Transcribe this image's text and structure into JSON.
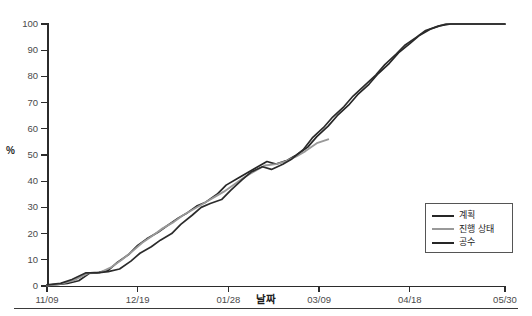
{
  "axes": {
    "y_label": "%",
    "x_label": "날짜",
    "y_ticks": [
      "0",
      "10",
      "20",
      "30",
      "40",
      "50",
      "60",
      "70",
      "80",
      "90",
      "100"
    ],
    "x_ticks": [
      "11/09",
      "12/19",
      "01/28",
      "03/09",
      "04/18",
      "05/30"
    ]
  },
  "legend": {
    "items": [
      {
        "label": "계획",
        "color": "#262626"
      },
      {
        "label": "진행 상태",
        "color": "#999999"
      },
      {
        "label": "공수",
        "color": "#262626"
      }
    ]
  },
  "colors": {
    "plan": "#262626",
    "progress": "#999999",
    "manhours": "#2b2b2b",
    "axis": "#2b2b2b",
    "tick_text": "#4a4a4a",
    "background": "#ffffff"
  },
  "chart_data": {
    "type": "line",
    "title": "",
    "subtitle": "",
    "xlabel": "날짜",
    "ylabel": "%",
    "xlim": [
      0,
      202
    ],
    "ylim": [
      0,
      100
    ],
    "grid": false,
    "legend_position": "bottom-right",
    "x_tick_labels": [
      "11/09",
      "12/19",
      "01/28",
      "03/09",
      "04/18",
      "05/30"
    ],
    "x_tick_values": [
      0,
      40,
      80,
      120,
      160,
      202
    ],
    "y_tick_values": [
      0,
      10,
      20,
      30,
      40,
      50,
      60,
      70,
      80,
      90,
      100
    ],
    "annotations": [],
    "series": [
      {
        "name": "계획",
        "color": "#262626",
        "points": [
          [
            0,
            0.3
          ],
          [
            5,
            0.6
          ],
          [
            9,
            1.0
          ],
          [
            14,
            2.0
          ],
          [
            19,
            5.0
          ],
          [
            23,
            5.2
          ],
          [
            27,
            6.0
          ],
          [
            31,
            9.0
          ],
          [
            36,
            12.0
          ],
          [
            40,
            15.5
          ],
          [
            44,
            18.0
          ],
          [
            49,
            20.5
          ],
          [
            53,
            23.0
          ],
          [
            58,
            26.0
          ],
          [
            62,
            28.0
          ],
          [
            66,
            30.5
          ],
          [
            70,
            32.0
          ],
          [
            75,
            35.0
          ],
          [
            79,
            38.5
          ],
          [
            84,
            41.0
          ],
          [
            88,
            43.0
          ],
          [
            92,
            45.0
          ],
          [
            97,
            47.5
          ],
          [
            101,
            46.5
          ],
          [
            106,
            48.0
          ],
          [
            110,
            50.0
          ],
          [
            115,
            53.0
          ],
          [
            119,
            57.0
          ],
          [
            124,
            61.0
          ],
          [
            128,
            65.0
          ],
          [
            133,
            69.0
          ],
          [
            137,
            73.0
          ],
          [
            142,
            77.0
          ],
          [
            146,
            81.0
          ],
          [
            151,
            85.0
          ],
          [
            155,
            89.0
          ],
          [
            160,
            92.5
          ],
          [
            164,
            95.5
          ],
          [
            169,
            98.0
          ],
          [
            173,
            99.3
          ],
          [
            178,
            100.0
          ],
          [
            187,
            100.0
          ],
          [
            196,
            100.0
          ],
          [
            202,
            100.0
          ]
        ]
      },
      {
        "name": "진행 상태",
        "color": "#999999",
        "points": [
          [
            0,
            0.2
          ],
          [
            6,
            0.8
          ],
          [
            12,
            2.2
          ],
          [
            18,
            4.8
          ],
          [
            23,
            5.0
          ],
          [
            28,
            7.0
          ],
          [
            33,
            10.0
          ],
          [
            38,
            13.5
          ],
          [
            42,
            16.5
          ],
          [
            47,
            19.5
          ],
          [
            51,
            22.0
          ],
          [
            56,
            24.5
          ],
          [
            60,
            27.0
          ],
          [
            65,
            29.5
          ],
          [
            69,
            31.5
          ],
          [
            74,
            34.0
          ],
          [
            78,
            36.0
          ],
          [
            83,
            39.0
          ],
          [
            87,
            41.5
          ],
          [
            92,
            44.0
          ],
          [
            96,
            46.0
          ],
          [
            101,
            46.5
          ],
          [
            105,
            47.5
          ],
          [
            110,
            49.5
          ],
          [
            114,
            51.5
          ],
          [
            119,
            54.5
          ],
          [
            124,
            56.0
          ]
        ]
      },
      {
        "name": "공수",
        "color": "#2b2b2b",
        "points": [
          [
            0,
            0.4
          ],
          [
            6,
            1.0
          ],
          [
            11,
            2.5
          ],
          [
            17,
            5.0
          ],
          [
            22,
            5.0
          ],
          [
            27,
            5.5
          ],
          [
            32,
            6.5
          ],
          [
            37,
            9.5
          ],
          [
            41,
            12.5
          ],
          [
            46,
            15.0
          ],
          [
            50,
            17.5
          ],
          [
            55,
            20.0
          ],
          [
            59,
            23.5
          ],
          [
            64,
            27.0
          ],
          [
            68,
            30.0
          ],
          [
            72,
            31.5
          ],
          [
            77,
            33.0
          ],
          [
            81,
            36.5
          ],
          [
            86,
            40.5
          ],
          [
            90,
            43.5
          ],
          [
            95,
            45.5
          ],
          [
            99,
            44.5
          ],
          [
            104,
            46.5
          ],
          [
            108,
            48.5
          ],
          [
            113,
            52.0
          ],
          [
            117,
            56.5
          ],
          [
            122,
            60.5
          ],
          [
            126,
            64.5
          ],
          [
            131,
            68.5
          ],
          [
            135,
            72.5
          ],
          [
            140,
            76.5
          ],
          [
            145,
            80.5
          ],
          [
            149,
            84.5
          ],
          [
            154,
            88.5
          ],
          [
            158,
            92.0
          ],
          [
            163,
            95.0
          ],
          [
            167,
            97.5
          ],
          [
            172,
            99.0
          ],
          [
            176,
            100.0
          ],
          [
            185,
            100.0
          ],
          [
            194,
            100.0
          ],
          [
            202,
            100.0
          ]
        ]
      }
    ]
  }
}
